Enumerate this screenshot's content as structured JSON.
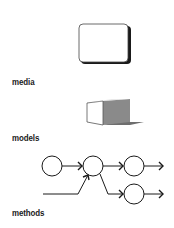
{
  "sections": [
    {
      "id": "media",
      "label": "media",
      "icon": "media-card-icon"
    },
    {
      "id": "models",
      "label": "models",
      "icon": "cube-model-icon"
    },
    {
      "id": "methods",
      "label": "methods",
      "icon": "network-flow-icon"
    }
  ],
  "colors": {
    "stroke": "#1a1a1a",
    "cube_front": "#ffffff",
    "cube_side": "#8a8a8a",
    "cube_top": "#d8d8d8",
    "shadow": "#555555"
  }
}
